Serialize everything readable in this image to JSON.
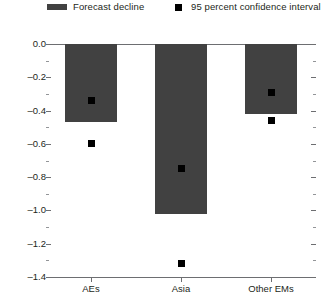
{
  "legend": {
    "forecast": {
      "label": "Forecast decline",
      "swatch": "bar-swatch",
      "color": "#414141"
    },
    "ci": {
      "label": "95 percent confidence interval",
      "swatch": "square-marker",
      "color": "#000000"
    }
  },
  "chart_data": {
    "type": "bar",
    "title": "",
    "subtitle": "",
    "xlabel": "",
    "ylabel": "",
    "categories": [
      "AEs",
      "Asia",
      "Other EMs"
    ],
    "values": [
      -0.47,
      -1.02,
      -0.42
    ],
    "series": [
      {
        "name": "Forecast decline",
        "values": [
          -0.47,
          -1.02,
          -0.42
        ]
      }
    ],
    "ci_upper": [
      -0.34,
      -0.75,
      -0.29
    ],
    "ci_lower": [
      -0.6,
      -1.32,
      -0.46
    ],
    "ci_label": "95 percent confidence interval",
    "ylim": [
      -1.4,
      0.0
    ],
    "ytick_labels": [
      "0.0",
      "-0.2",
      "-0.4",
      "-0.6",
      "-0.8",
      "-1.0",
      "-1.2",
      "-1.4"
    ],
    "ytick_values": [
      0.0,
      -0.2,
      -0.4,
      -0.6,
      -0.8,
      -1.0,
      -1.2,
      -1.4
    ],
    "minor_tick_step": 0.1,
    "grid": false,
    "legend_position": "top"
  },
  "colors": {
    "bar": "#414141",
    "marker": "#000000",
    "axis": "#6d6e71",
    "text": "#231f20"
  }
}
